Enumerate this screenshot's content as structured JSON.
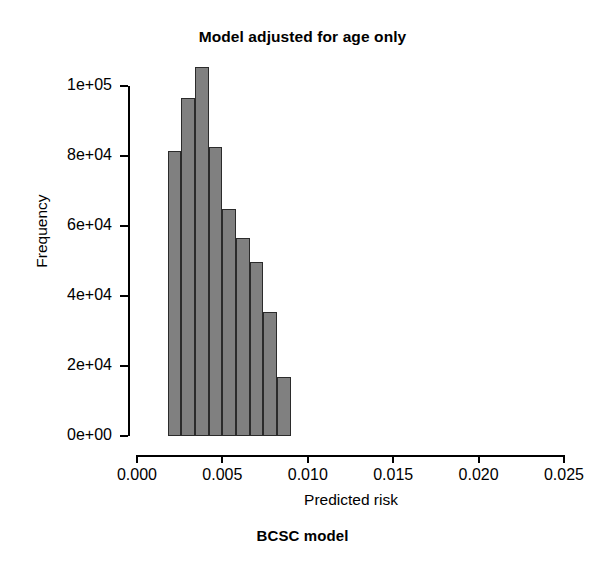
{
  "chart_data": {
    "type": "bar",
    "title": "Model adjusted for age only",
    "caption": "BCSC model",
    "xlabel": "Predicted risk",
    "ylabel": "Frequency",
    "xlim": [
      0.0,
      0.025
    ],
    "ylim": [
      0,
      100000
    ],
    "grid": false,
    "legend": null,
    "bin_width": 0.0008,
    "xticks": [
      0.0,
      0.005,
      0.01,
      0.015,
      0.02,
      0.025
    ],
    "xtick_labels": [
      "0.000",
      "0.005",
      "0.010",
      "0.015",
      "0.020",
      "0.025"
    ],
    "yticks": [
      0,
      20000,
      40000,
      60000,
      80000,
      100000
    ],
    "ytick_labels": [
      "0e+00",
      "2e+04",
      "4e+04",
      "6e+04",
      "8e+04",
      "1e+05"
    ],
    "bins": [
      {
        "x0": 0.0018,
        "x1": 0.0026,
        "value": 81500
      },
      {
        "x0": 0.0026,
        "x1": 0.0034,
        "value": 96500
      },
      {
        "x0": 0.0034,
        "x1": 0.0042,
        "value": 105500
      },
      {
        "x0": 0.0042,
        "x1": 0.005,
        "value": 82500
      },
      {
        "x0": 0.005,
        "x1": 0.0058,
        "value": 65000
      },
      {
        "x0": 0.0058,
        "x1": 0.0066,
        "value": 56500
      },
      {
        "x0": 0.0066,
        "x1": 0.0074,
        "value": 49700
      },
      {
        "x0": 0.0074,
        "x1": 0.0082,
        "value": 35500
      },
      {
        "x0": 0.0082,
        "x1": 0.009,
        "value": 17000
      }
    ],
    "categories": [
      "0.0022",
      "0.0030",
      "0.0038",
      "0.0046",
      "0.0054",
      "0.0062",
      "0.0070",
      "0.0078",
      "0.0086"
    ],
    "values": [
      81500,
      96500,
      105500,
      82500,
      65000,
      56500,
      49700,
      35500,
      17000
    ],
    "colors": {
      "bar_fill": "#808080",
      "bar_border": "#2b2b2b",
      "axis": "#000000",
      "background": "#ffffff"
    }
  }
}
